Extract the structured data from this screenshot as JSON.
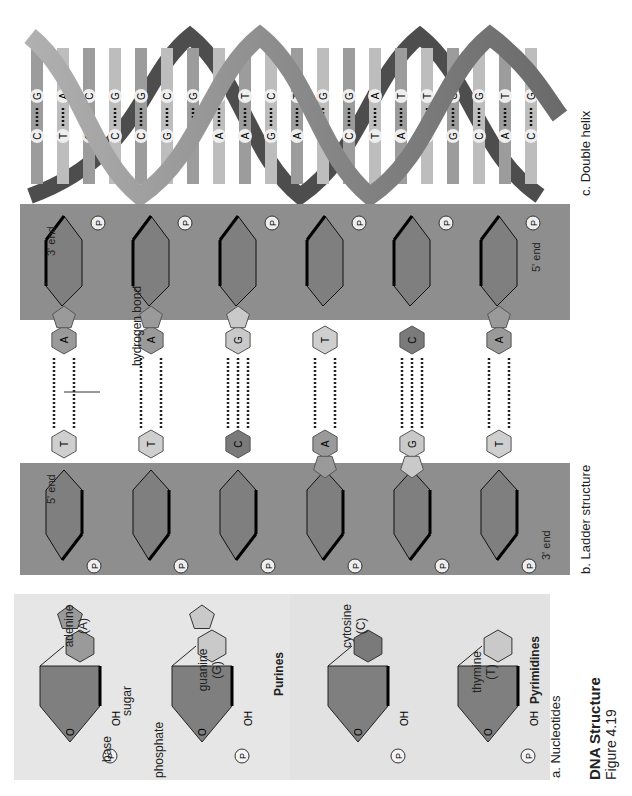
{
  "figure": {
    "title": "DNA Structure",
    "subtitle": "Figure 4.19",
    "orientation": "rotated 90 degrees counter-clockwise"
  },
  "panels": {
    "nucleotides": {
      "label": "a. Nucleotides",
      "purines": {
        "group_label": "Purines",
        "items": [
          {
            "name": "adenine",
            "abbr": "(A)",
            "substituent": "NH2"
          },
          {
            "name": "guanine",
            "abbr": "(G)",
            "substituent": "O / H2N"
          }
        ]
      },
      "pyrimidines": {
        "group_label": "Pyrimidines",
        "items": [
          {
            "name": "cytosine",
            "abbr": "(C)",
            "substituent": "NH2"
          },
          {
            "name": "thymine",
            "abbr": "(T)",
            "substituent": "CH3"
          }
        ]
      },
      "annotations": {
        "base": "base",
        "phosphate": "phosphate",
        "sugar": "sugar",
        "phosphate_symbol": "P",
        "oxygen": "O",
        "hydroxyl": "OH",
        "carbon_numbers": [
          "1",
          "2",
          "3",
          "4",
          "5"
        ],
        "atoms": {
          "N": "N",
          "HN": "HN",
          "NH2": "NH",
          "H2N": "H",
          "CH3": "CH"
        }
      }
    },
    "ladder": {
      "label": "b. Ladder structure",
      "hydrogen_bond_label": "hydrogen bond",
      "left_strand": {
        "top_end": "5' end",
        "bottom_end": "3' end"
      },
      "right_strand": {
        "top_end": "3' end",
        "bottom_end": "5' end"
      },
      "phosphate_symbol": "P",
      "base_pairs": [
        {
          "left": "T",
          "right": "A",
          "bonds": 2
        },
        {
          "left": "T",
          "right": "A",
          "bonds": 2
        },
        {
          "left": "C",
          "right": "G",
          "bonds": 3
        },
        {
          "left": "A",
          "right": "T",
          "bonds": 2
        },
        {
          "left": "G",
          "right": "C",
          "bonds": 3
        },
        {
          "left": "T",
          "right": "A",
          "bonds": 2
        }
      ]
    },
    "double_helix": {
      "label": "c. Double helix",
      "rungs": [
        {
          "a": "C",
          "b": "G"
        },
        {
          "a": "T",
          "b": "A"
        },
        {
          "a": "G",
          "b": "C"
        },
        {
          "a": "C",
          "b": "G"
        },
        {
          "a": "C",
          "b": "G"
        },
        {
          "a": "G",
          "b": "C"
        },
        {
          "a": "C",
          "b": "G"
        },
        {
          "a": "A",
          "b": "T"
        },
        {
          "a": "A",
          "b": "T"
        },
        {
          "a": "G",
          "b": "C"
        },
        {
          "a": "A",
          "b": "T"
        },
        {
          "a": "C",
          "b": "G"
        },
        {
          "a": "C",
          "b": "G"
        },
        {
          "a": "T",
          "b": "A"
        },
        {
          "a": "A",
          "b": "T"
        },
        {
          "a": "A",
          "b": "T"
        },
        {
          "a": "G",
          "b": "C"
        },
        {
          "a": "C",
          "b": "G"
        },
        {
          "a": "A",
          "b": "T"
        },
        {
          "a": "C",
          "b": "G"
        }
      ]
    }
  },
  "colors": {
    "background": "#ffffff",
    "ladder_band": "#8e8e8e",
    "sugar_fill": "#7f7f7f",
    "nucleotide_panel": "#e6e6e6",
    "purine_dark": "#9a9a9a",
    "pyrimidine_light": "#c9c9c9",
    "cytosine_dark": "#7a7a7a",
    "helix_ribbon": "#8f8f8f",
    "helix_ribbon_dark": "#4a4a4a"
  }
}
